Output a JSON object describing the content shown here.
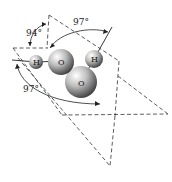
{
  "diagram": {
    "angle_labels": {
      "top_left": "94°",
      "top_right": "97°",
      "bottom_left": "97°"
    },
    "atoms": [
      {
        "id": "h_left",
        "symbol": "H"
      },
      {
        "id": "o_upper",
        "symbol": "O"
      },
      {
        "id": "h_right",
        "symbol": "H"
      },
      {
        "id": "o_lower",
        "symbol": "O"
      }
    ],
    "colors": {
      "line": "#333333",
      "atom_light": "#f2f2f2",
      "atom_dark": "#555555"
    }
  }
}
